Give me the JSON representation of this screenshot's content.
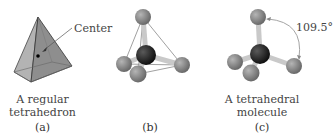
{
  "panels": [
    {
      "id": "a",
      "letter": "(a)",
      "caption_line1": "A regular",
      "caption_line2": "tetrahedron",
      "annotation": "Center"
    },
    {
      "id": "b",
      "letter": "(b)"
    },
    {
      "id": "c",
      "letter": "(c)",
      "caption_line1": "A tetrahedral",
      "caption_line2": "molecule",
      "angle_label": "109.5°"
    }
  ],
  "colors": {
    "tetra_left_face": "#a9a9a9",
    "tetra_right_face": "#8f8f8f",
    "outer_atom": "#7f7f7f",
    "center_atom": "#1f1f1f",
    "bond": "#c8c8c8",
    "angle_arc": "#9a9a9a"
  }
}
